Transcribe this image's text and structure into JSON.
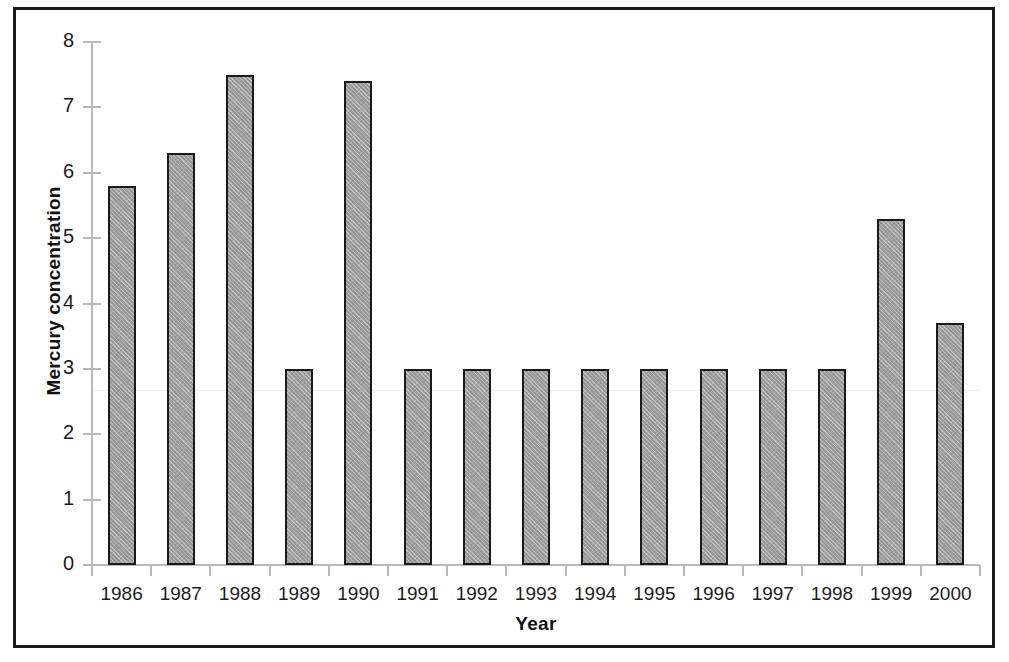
{
  "chart_data": {
    "type": "bar",
    "title": "",
    "xlabel": "Year",
    "ylabel": "Mercury concentration",
    "categories": [
      "1986",
      "1987",
      "1988",
      "1989",
      "1990",
      "1991",
      "1992",
      "1993",
      "1994",
      "1995",
      "1996",
      "1997",
      "1998",
      "1999",
      "2000"
    ],
    "values": [
      5.8,
      6.3,
      7.5,
      3.0,
      7.4,
      3.0,
      3.0,
      3.0,
      3.0,
      3.0,
      3.0,
      3.0,
      3.0,
      5.3,
      3.7
    ],
    "ylim": [
      0,
      8
    ],
    "yticks": [
      "0",
      "1",
      "2",
      "3",
      "4",
      "5",
      "6",
      "7",
      "8"
    ],
    "ytick_values": [
      0,
      1,
      2,
      3,
      4,
      5,
      6,
      7,
      8
    ],
    "grid": false,
    "legend": null,
    "legend_position": "none",
    "colors": {
      "bar_fill": "#9d9d9d",
      "bar_border": "#1a1a1a",
      "axis_line": "#b9b9b9",
      "text": "#1c1c1c",
      "frame_border": "#1a1a1a",
      "background": "#ffffff"
    }
  }
}
